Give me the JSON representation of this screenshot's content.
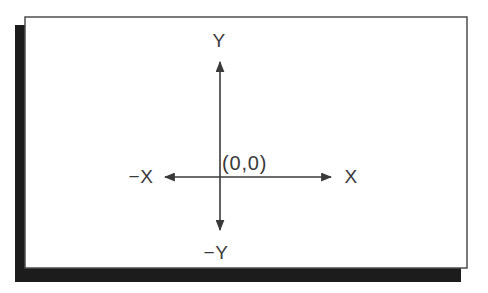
{
  "diagram": {
    "kind": "cartesian-coordinate-plane",
    "origin_label": "(0,0)",
    "axes": {
      "x_positive": "X",
      "x_negative": "−X",
      "y_positive": "Y",
      "y_negative": "−Y"
    },
    "colors": {
      "background": "#ffffff",
      "panel_fill": "#ffffff",
      "panel_border": "#4d4d4d",
      "shadow": "#1c1c1c",
      "axis_line": "#3a3a3a",
      "text": "#3a3a3a"
    }
  }
}
